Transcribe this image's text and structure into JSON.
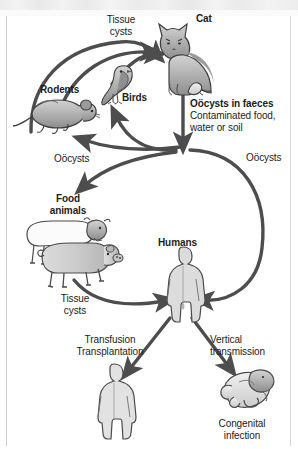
{
  "diagram": {
    "type": "life-cycle-diagram",
    "colors": {
      "background": "#ffffff",
      "arrow": "#4d4d4d",
      "text": "#1c1c1c",
      "animal_fill": "#b0b0b0",
      "animal_outline": "#4a4a4a"
    },
    "labels": {
      "tissue_cysts_top": "Tissue\ncysts",
      "cat": "Cat",
      "rodents": "Rodents",
      "birds": "Birds",
      "oocysts_in_faeces": "Oöcysts in faeces",
      "contaminated": "Contaminated food,\nwater or soil",
      "oocysts_left": "Oöcysts",
      "oocysts_right": "Oöcysts",
      "food_animals": "Food\nanimals",
      "humans": "Humans",
      "tissue_cysts_human": "Tissue\ncysts",
      "transfusion_transplantation": "Transfusion\nTransplantation",
      "vertical_transmission": "Vertical\ntransmission",
      "congenital_infection": "Congenital\ninfection"
    },
    "nodes": [
      {
        "id": "cat",
        "label": "Cat",
        "emphasis": "bold"
      },
      {
        "id": "rodents",
        "label": "Rodents",
        "emphasis": "bold"
      },
      {
        "id": "birds",
        "label": "Birds",
        "emphasis": "bold"
      },
      {
        "id": "food-animals",
        "label": "Food animals",
        "emphasis": "bold"
      },
      {
        "id": "humans",
        "label": "Humans",
        "emphasis": "bold"
      },
      {
        "id": "recipient-human",
        "label": "",
        "emphasis": "none"
      },
      {
        "id": "foetus",
        "label": "Congenital infection",
        "emphasis": "none"
      }
    ],
    "edges": [
      {
        "from": "rodents",
        "to": "cat",
        "label": "Tissue cysts"
      },
      {
        "from": "birds",
        "to": "cat",
        "label": "Tissue cysts"
      },
      {
        "from": "cat",
        "to": "oocysts",
        "label": "Oöcysts in faeces"
      },
      {
        "from": "oocysts",
        "to": "rodents",
        "label": "Oöcysts"
      },
      {
        "from": "oocysts",
        "to": "birds",
        "label": "Oöcysts"
      },
      {
        "from": "oocysts",
        "to": "food-animals",
        "label": "Oöcysts"
      },
      {
        "from": "oocysts",
        "to": "humans",
        "label": "Oöcysts"
      },
      {
        "from": "food-animals",
        "to": "humans",
        "label": "Tissue cysts"
      },
      {
        "from": "humans",
        "to": "recipient-human",
        "label": "Transfusion Transplantation"
      },
      {
        "from": "humans",
        "to": "foetus",
        "label": "Vertical transmission"
      }
    ]
  }
}
